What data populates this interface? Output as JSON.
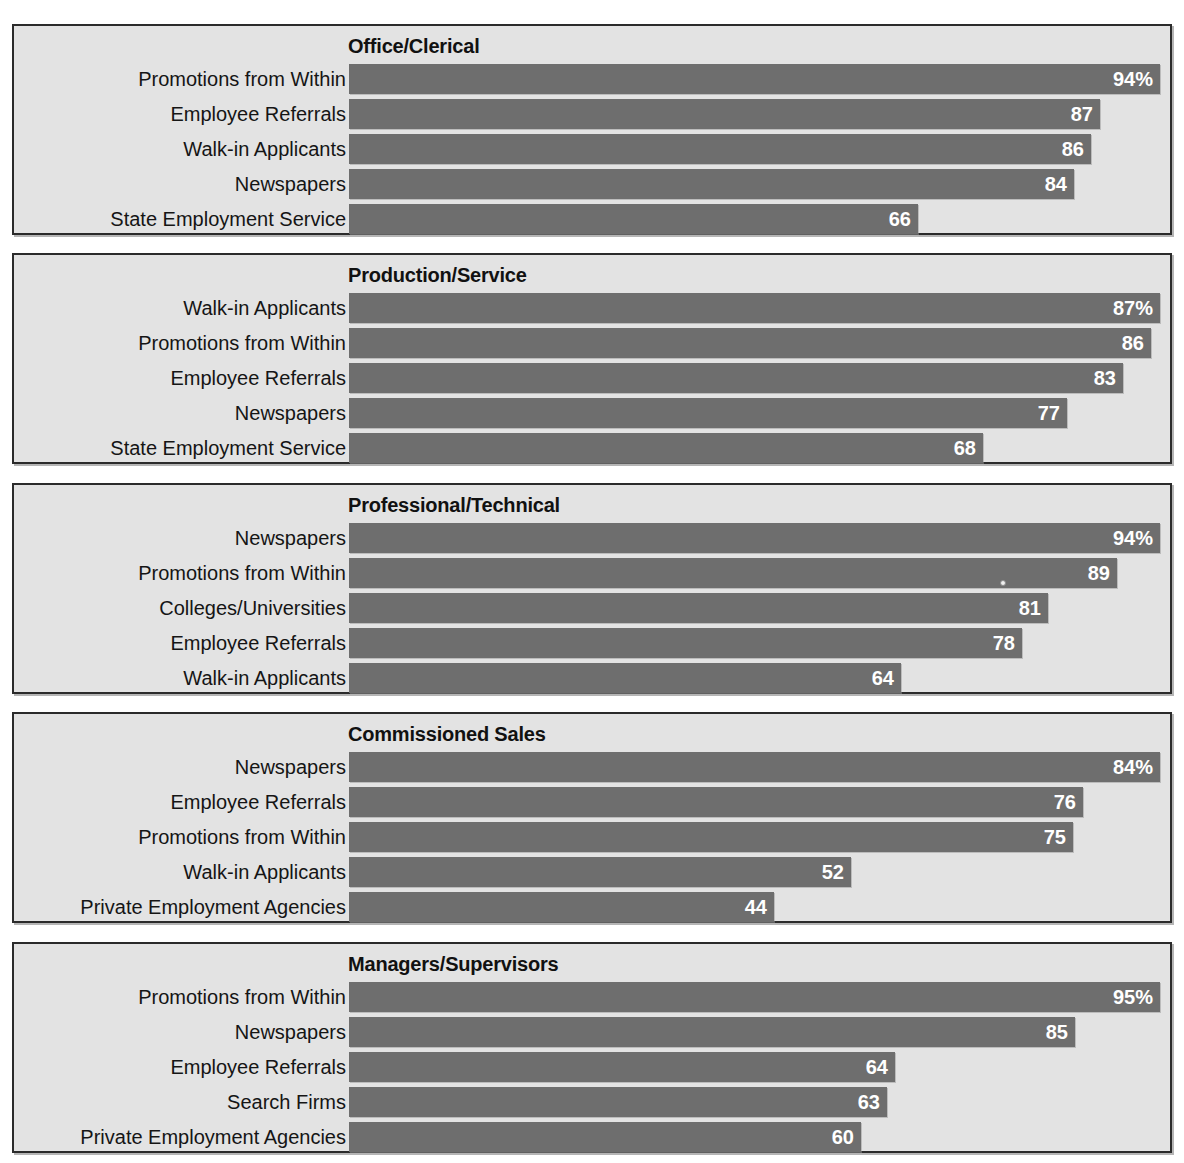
{
  "chart_data": {
    "type": "bar",
    "xlabel": "Percent of employers using source",
    "ylabel": "Recruitment source",
    "xlim": [
      0,
      100
    ],
    "grid": false,
    "legend": "none",
    "orientation": "horizontal",
    "value_suffix_first_bar": "%",
    "panels": [
      {
        "title": "Office/Clerical",
        "categories": [
          "Promotions from Within",
          "Employee Referrals",
          "Walk-in Applicants",
          "Newspapers",
          "State Employment Service"
        ],
        "values": [
          94,
          87,
          86,
          84,
          66
        ],
        "labels": [
          "94%",
          "87",
          "86",
          "84",
          "66"
        ]
      },
      {
        "title": "Production/Service",
        "categories": [
          "Walk-in Applicants",
          "Promotions from Within",
          "Employee Referrals",
          "Newspapers",
          "State Employment Service"
        ],
        "values": [
          87,
          86,
          83,
          77,
          68
        ],
        "labels": [
          "87%",
          "86",
          "83",
          "77",
          "68"
        ]
      },
      {
        "title": "Professional/Technical",
        "categories": [
          "Newspapers",
          "Promotions from Within",
          "Colleges/Universities",
          "Employee Referrals",
          "Walk-in Applicants"
        ],
        "values": [
          94,
          89,
          81,
          78,
          64
        ],
        "labels": [
          "94%",
          "89",
          "81",
          "78",
          "64"
        ]
      },
      {
        "title": "Commissioned Sales",
        "categories": [
          "Newspapers",
          "Employee Referrals",
          "Promotions from Within",
          "Walk-in Applicants",
          "Private Employment Agencies"
        ],
        "values": [
          84,
          76,
          75,
          52,
          44
        ],
        "labels": [
          "84%",
          "76",
          "75",
          "52",
          "44"
        ]
      },
      {
        "title": "Managers/Supervisors",
        "categories": [
          "Promotions from Within",
          "Newspapers",
          "Employee Referrals",
          "Search Firms",
          "Private Employment Agencies"
        ],
        "values": [
          95,
          85,
          64,
          63,
          60
        ],
        "labels": [
          "95%",
          "85",
          "64",
          "63",
          "60"
        ]
      }
    ]
  },
  "colors": {
    "bar": "#6e6e6e",
    "panel_background": "#e3e3e3",
    "panel_border": "#2b2b2b",
    "value_text": "#ffffff",
    "label_text": "#151515",
    "page_background": "#ffffff"
  }
}
